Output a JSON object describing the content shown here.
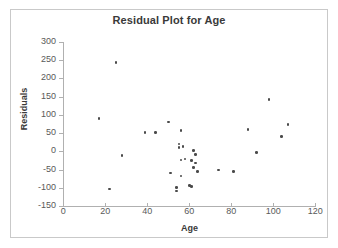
{
  "chart_data": {
    "type": "scatter",
    "title": "Residual Plot for Age",
    "xlabel": "Age",
    "ylabel": "Residuals",
    "xlim": [
      0,
      120
    ],
    "ylim": [
      -150,
      300
    ],
    "xticks": [
      0,
      20,
      40,
      60,
      80,
      100,
      120
    ],
    "yticks": [
      -150,
      -100,
      -50,
      0,
      50,
      100,
      150,
      200,
      250,
      300
    ],
    "grid": false,
    "legend": null,
    "marker_color": "#4a4a4a",
    "series": [
      {
        "name": "Residuals",
        "x": [
          17,
          22,
          25,
          28,
          39,
          44,
          50,
          51,
          54,
          54,
          55,
          55,
          56,
          56,
          56,
          57,
          58,
          60,
          61,
          61,
          62,
          62,
          63,
          63,
          64,
          74,
          81,
          88,
          92,
          98,
          104,
          107
        ],
        "y": [
          90,
          -103,
          243,
          -12,
          52,
          52,
          81,
          -59,
          -100,
          -109,
          20,
          10,
          57,
          -24,
          -68,
          13,
          -21,
          -94,
          -97,
          -25,
          2,
          -44,
          -9,
          -32,
          -56,
          -51,
          -55,
          60,
          -3,
          143,
          41,
          73
        ]
      }
    ]
  },
  "axes": {
    "y_tick_labels": [
      "300",
      "250",
      "200",
      "150",
      "100",
      "50",
      "0",
      "-50",
      "-100",
      "-150"
    ],
    "x_tick_labels": [
      "0",
      "20",
      "40",
      "60",
      "80",
      "100",
      "120"
    ]
  }
}
